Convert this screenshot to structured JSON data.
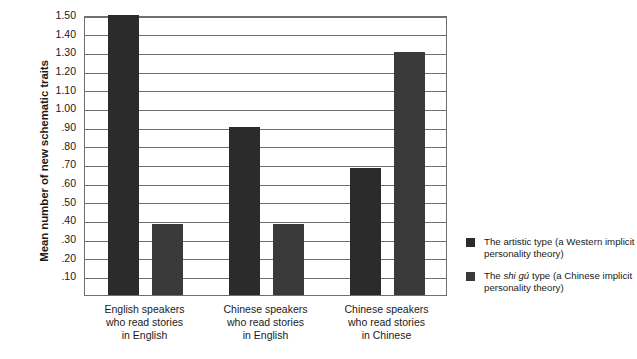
{
  "chart_data": {
    "type": "bar",
    "title": "",
    "xlabel": "",
    "ylabel": "Mean number of new schematic traits",
    "ylim": [
      0,
      1.5
    ],
    "grid": true,
    "legend_position": "right",
    "categories": [
      "English speakers\nwho read stories\nin English",
      "Chinese speakers\nwho read stories\nin English",
      "Chinese speakers\nwho read stories\nin Chinese"
    ],
    "ytick_labels": [
      "1.50",
      "1.40",
      "1.30",
      "1.20",
      "1.10",
      "1.00",
      ".90",
      ".80",
      ".70",
      ".60",
      ".50",
      ".40",
      ".30",
      ".20",
      ".10"
    ],
    "ytick_values": [
      1.5,
      1.4,
      1.3,
      1.2,
      1.1,
      1.0,
      0.9,
      0.8,
      0.7,
      0.6,
      0.5,
      0.4,
      0.3,
      0.2,
      0.1
    ],
    "series": [
      {
        "name": "The artistic type (a Western implicit personality theory)",
        "color": "#2b2b2b",
        "values": [
          1.5,
          0.9,
          0.68
        ]
      },
      {
        "name": "The shi gú type (a Chinese implicit personality theory)",
        "color": "#3a3a3a",
        "values": [
          0.38,
          0.38,
          1.3
        ]
      }
    ]
  },
  "legend": {
    "items": [
      {
        "prefix": "The artistic type (a Western implicit personality theory)",
        "pre": "The artistic type (a Western implicit",
        "italic": "",
        "post": " personality theory)",
        "swatch": "#2b2b2b"
      },
      {
        "prefix": "The shi gú type (a Chinese implicit personality theory)",
        "pre": "The ",
        "italic": "shi gú",
        "post": " type (a Chinese implicit personality theory)",
        "swatch": "#3a3a3a"
      }
    ]
  },
  "axis": {
    "y_title": "Mean number of new schematic traits"
  }
}
